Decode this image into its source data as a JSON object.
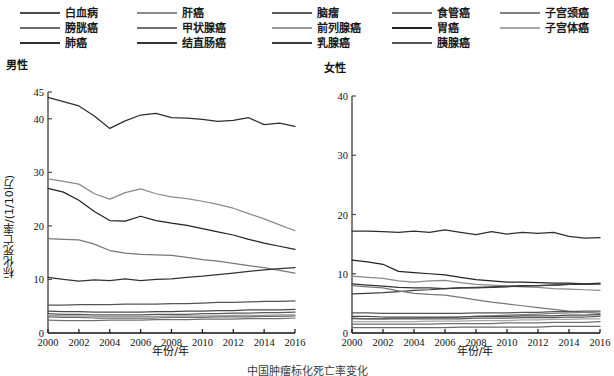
{
  "legend": {
    "columns": [
      {
        "x": 20,
        "items": [
          {
            "label": "白血病",
            "color": "#4a4a4a"
          },
          {
            "label": "膀胱癌",
            "color": "#6b6b6b"
          },
          {
            "label": "肺癌",
            "color": "#2e2e2e"
          }
        ]
      },
      {
        "x": 137,
        "items": [
          {
            "label": "肝癌",
            "color": "#8a8a8a"
          },
          {
            "label": "甲状腺癌",
            "color": "#707070"
          },
          {
            "label": "结直肠癌",
            "color": "#333333"
          }
        ]
      },
      {
        "x": 272,
        "items": [
          {
            "label": "脑瘤",
            "color": "#5a5a5a"
          },
          {
            "label": "前列腺癌",
            "color": "#9a9a9a"
          },
          {
            "label": "乳腺癌",
            "color": "#3c3c3c"
          }
        ]
      },
      {
        "x": 392,
        "items": [
          {
            "label": "食管癌",
            "color": "#777777"
          },
          {
            "label": "胃癌",
            "color": "#222222"
          },
          {
            "label": "胰腺癌",
            "color": "#555555"
          }
        ]
      },
      {
        "x": 500,
        "items": [
          {
            "label": "子宫颈癌",
            "color": "#808080"
          },
          {
            "label": "子宫体癌",
            "color": "#a8a8a8"
          }
        ]
      }
    ]
  },
  "chart_data": [
    {
      "type": "line",
      "panel": "male",
      "title": "男性",
      "xlabel": "年份/年",
      "ylabel": "标化死亡率/(1/10万)",
      "xlim": [
        2000,
        2016
      ],
      "ylim": [
        0,
        45
      ],
      "yticks": [
        0,
        10,
        20,
        30,
        40,
        45
      ],
      "xticks": [
        2000,
        2002,
        2004,
        2006,
        2008,
        2010,
        2012,
        2014,
        2016
      ],
      "grid": false,
      "legend_position": "top",
      "x": [
        2000,
        2001,
        2002,
        2003,
        2004,
        2005,
        2006,
        2007,
        2008,
        2009,
        2010,
        2011,
        2012,
        2013,
        2014,
        2015,
        2016
      ],
      "series": [
        {
          "name": "肺癌",
          "color": "#2e2e2e",
          "values": [
            44.0,
            43.2,
            42.4,
            40.5,
            38.2,
            39.6,
            40.7,
            41.0,
            40.2,
            40.1,
            39.9,
            39.5,
            39.7,
            40.2,
            38.9,
            39.2,
            38.6
          ]
        },
        {
          "name": "肝癌",
          "color": "#8a8a8a",
          "values": [
            28.8,
            28.3,
            27.8,
            26.0,
            25.0,
            26.2,
            26.9,
            26.0,
            25.4,
            25.1,
            24.6,
            24.0,
            23.3,
            22.3,
            21.3,
            20.2,
            19.1
          ]
        },
        {
          "name": "胃癌",
          "color": "#222222",
          "values": [
            27.0,
            26.3,
            24.8,
            22.7,
            21.0,
            20.9,
            21.8,
            21.0,
            20.5,
            20.1,
            19.5,
            18.9,
            18.3,
            17.5,
            16.8,
            16.2,
            15.6
          ]
        },
        {
          "name": "食管癌",
          "color": "#777777",
          "values": [
            17.6,
            17.5,
            17.4,
            16.6,
            15.4,
            14.9,
            14.7,
            14.6,
            14.5,
            14.1,
            13.7,
            13.4,
            13.0,
            12.6,
            12.2,
            11.7,
            11.2
          ]
        },
        {
          "name": "结直肠癌",
          "color": "#333333",
          "values": [
            10.4,
            10.0,
            9.7,
            9.9,
            9.8,
            10.1,
            9.8,
            10.0,
            10.1,
            10.4,
            10.6,
            10.9,
            11.2,
            11.5,
            11.8,
            12.0,
            12.2
          ]
        },
        {
          "name": "胰腺癌",
          "color": "#555555",
          "values": [
            5.2,
            5.2,
            5.3,
            5.3,
            5.3,
            5.4,
            5.4,
            5.4,
            5.5,
            5.5,
            5.6,
            5.7,
            5.7,
            5.8,
            5.9,
            5.9,
            6.0
          ]
        },
        {
          "name": "白血病",
          "color": "#4a4a4a",
          "values": [
            4.1,
            4.0,
            4.0,
            3.9,
            3.9,
            3.9,
            3.9,
            4.0,
            4.0,
            4.1,
            4.1,
            4.2,
            4.2,
            4.3,
            4.3,
            4.3,
            4.4
          ]
        },
        {
          "name": "脑瘤",
          "color": "#5a5a5a",
          "values": [
            3.6,
            3.5,
            3.5,
            3.4,
            3.4,
            3.4,
            3.4,
            3.5,
            3.5,
            3.5,
            3.6,
            3.6,
            3.7,
            3.7,
            3.8,
            3.8,
            3.9
          ]
        },
        {
          "name": "前列腺癌",
          "color": "#9a9a9a",
          "values": [
            3.3,
            3.2,
            3.2,
            3.1,
            3.1,
            3.1,
            3.1,
            3.1,
            3.2,
            3.2,
            3.2,
            3.2,
            3.3,
            3.3,
            3.3,
            3.4,
            3.4
          ]
        },
        {
          "name": "膀胱癌",
          "color": "#6b6b6b",
          "values": [
            3.0,
            2.9,
            2.9,
            2.8,
            2.8,
            2.8,
            2.8,
            2.8,
            2.9,
            2.9,
            2.9,
            3.0,
            3.0,
            3.0,
            3.1,
            3.1,
            3.2
          ]
        },
        {
          "name": "甲状腺癌",
          "color": "#707070",
          "values": [
            2.4,
            2.3,
            2.3,
            2.3,
            2.4,
            2.4,
            2.4,
            2.5,
            2.5,
            2.5,
            2.6,
            2.6,
            2.6,
            2.7,
            2.7,
            2.7,
            2.8
          ]
        }
      ]
    },
    {
      "type": "line",
      "panel": "female",
      "title": "女性",
      "xlabel": "年份/年",
      "ylabel": "",
      "xlim": [
        2000,
        2016
      ],
      "ylim": [
        0,
        40
      ],
      "yticks": [
        0,
        10,
        20,
        30,
        40
      ],
      "xticks": [
        2000,
        2002,
        2004,
        2006,
        2008,
        2010,
        2012,
        2014,
        2016
      ],
      "grid": false,
      "legend_position": "top",
      "x": [
        2000,
        2001,
        2002,
        2003,
        2004,
        2005,
        2006,
        2007,
        2008,
        2009,
        2010,
        2011,
        2012,
        2013,
        2014,
        2015,
        2016
      ],
      "series": [
        {
          "name": "肺癌",
          "color": "#2e2e2e",
          "values": [
            17.2,
            17.2,
            17.1,
            17.0,
            17.2,
            17.0,
            17.4,
            17.0,
            16.6,
            17.1,
            16.7,
            17.0,
            16.8,
            17.0,
            16.3,
            16.0,
            16.1
          ]
        },
        {
          "name": "胃癌",
          "color": "#222222",
          "values": [
            12.3,
            12.0,
            11.6,
            10.4,
            10.2,
            10.0,
            9.8,
            9.4,
            9.0,
            8.8,
            8.6,
            8.6,
            8.5,
            8.4,
            8.4,
            8.3,
            8.3
          ]
        },
        {
          "name": "肝癌",
          "color": "#8a8a8a",
          "values": [
            9.6,
            9.4,
            9.2,
            8.8,
            8.6,
            8.8,
            8.9,
            8.5,
            8.2,
            8.1,
            7.9,
            7.8,
            7.7,
            7.5,
            7.4,
            7.3,
            7.2
          ]
        },
        {
          "name": "结直肠癌",
          "color": "#333333",
          "values": [
            8.3,
            8.1,
            7.9,
            7.7,
            7.6,
            7.6,
            7.5,
            7.6,
            7.6,
            7.7,
            7.8,
            7.9,
            8.0,
            8.1,
            8.2,
            8.3,
            8.4
          ]
        },
        {
          "name": "乳腺癌",
          "color": "#3c3c3c",
          "values": [
            6.6,
            6.7,
            6.8,
            7.0,
            7.2,
            7.3,
            7.5,
            7.6,
            7.7,
            7.8,
            7.9,
            8.0,
            8.0,
            8.1,
            8.2,
            8.2,
            8.3
          ]
        },
        {
          "name": "食管癌",
          "color": "#777777",
          "values": [
            8.0,
            7.8,
            7.6,
            7.1,
            6.7,
            6.5,
            6.4,
            6.0,
            5.6,
            5.2,
            4.9,
            4.6,
            4.3,
            4.0,
            3.7,
            3.5,
            3.3
          ]
        },
        {
          "name": "胰腺癌",
          "color": "#555555",
          "values": [
            3.4,
            3.4,
            3.3,
            3.3,
            3.3,
            3.3,
            3.3,
            3.3,
            3.4,
            3.4,
            3.4,
            3.5,
            3.5,
            3.6,
            3.6,
            3.7,
            3.7
          ]
        },
        {
          "name": "子宫颈癌",
          "color": "#808080",
          "values": [
            2.4,
            2.4,
            2.4,
            2.5,
            2.5,
            2.6,
            2.6,
            2.7,
            2.8,
            2.9,
            3.0,
            3.1,
            3.2,
            3.3,
            3.4,
            3.5,
            3.6
          ]
        },
        {
          "name": "白血病",
          "color": "#4a4a4a",
          "values": [
            2.8,
            2.8,
            2.7,
            2.7,
            2.7,
            2.7,
            2.7,
            2.7,
            2.8,
            2.8,
            2.8,
            2.9,
            2.9,
            2.9,
            3.0,
            3.0,
            3.1
          ]
        },
        {
          "name": "脑瘤",
          "color": "#5a5a5a",
          "values": [
            2.5,
            2.4,
            2.4,
            2.4,
            2.4,
            2.4,
            2.4,
            2.4,
            2.5,
            2.5,
            2.5,
            2.6,
            2.6,
            2.6,
            2.7,
            2.7,
            2.8
          ]
        },
        {
          "name": "子宫体癌",
          "color": "#a8a8a8",
          "values": [
            1.9,
            1.9,
            1.9,
            1.9,
            1.9,
            2.0,
            2.0,
            2.0,
            2.1,
            2.1,
            2.1,
            2.2,
            2.2,
            2.3,
            2.3,
            2.4,
            2.4
          ]
        },
        {
          "name": "甲状腺癌",
          "color": "#707070",
          "values": [
            1.5,
            1.5,
            1.5,
            1.5,
            1.5,
            1.5,
            1.6,
            1.6,
            1.6,
            1.6,
            1.7,
            1.7,
            1.7,
            1.8,
            1.8,
            1.8,
            1.9
          ]
        },
        {
          "name": "膀胱癌",
          "color": "#6b6b6b",
          "values": [
            0.9,
            0.9,
            0.9,
            0.9,
            0.9,
            0.9,
            0.9,
            1.0,
            1.0,
            1.0,
            1.0,
            1.0,
            1.0,
            1.1,
            1.1,
            1.1,
            1.1
          ]
        }
      ]
    }
  ],
  "caption": "中国肿瘤标化死亡率变化"
}
